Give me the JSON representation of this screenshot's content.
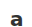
{
  "glyph": {
    "text": "a",
    "color": "#333333"
  },
  "background": "#ffffff"
}
